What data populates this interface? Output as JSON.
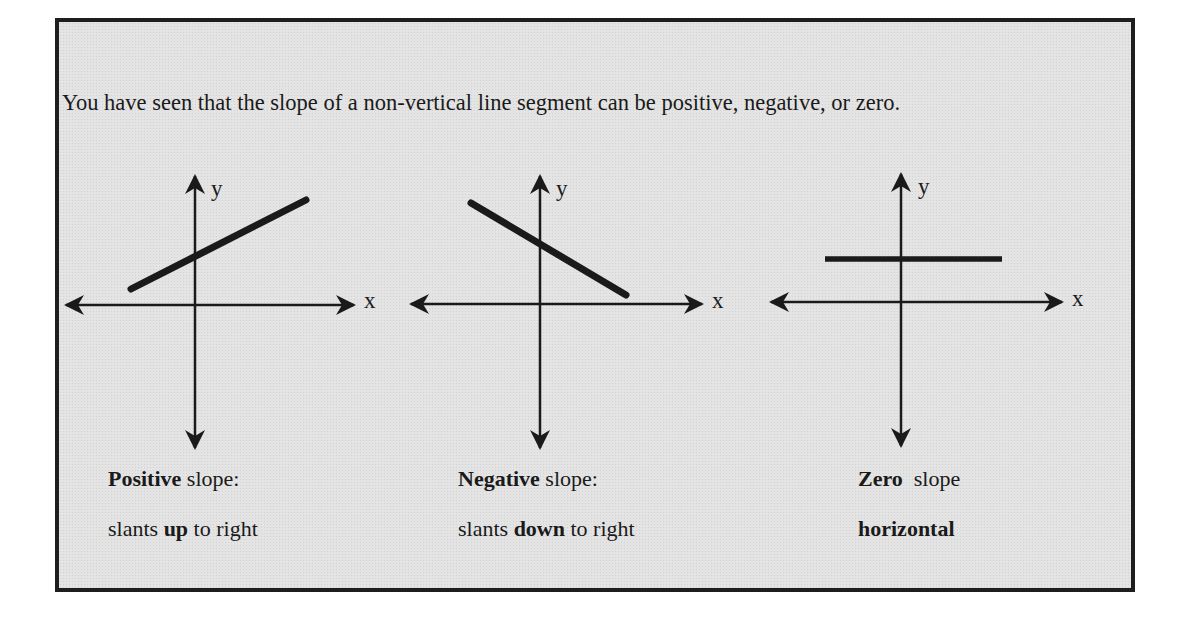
{
  "intro_text": "You have seen that the slope of a non-vertical line segment can be positive, negative, or zero.",
  "diagrams": [
    {
      "id": "positive",
      "axis_labels": {
        "x": "x",
        "y": "y"
      },
      "caption_line1_bold": "Positive",
      "caption_line1_rest": " slope:",
      "caption_line2_pre": "slants ",
      "caption_line2_bold": "up",
      "caption_line2_post": " to right"
    },
    {
      "id": "negative",
      "axis_labels": {
        "x": "x",
        "y": "y"
      },
      "caption_line1_bold": "Negative",
      "caption_line1_rest": " slope:",
      "caption_line2_pre": "slants ",
      "caption_line2_bold": "down",
      "caption_line2_post": " to right"
    },
    {
      "id": "zero",
      "axis_labels": {
        "x": "x",
        "y": "y"
      },
      "caption_line1_bold": "Zero",
      "caption_line1_rest": "  slope",
      "caption_line2_pre": "",
      "caption_line2_bold": "horizontal",
      "caption_line2_post": ""
    }
  ],
  "colors": {
    "ink": "#1a1a1a",
    "panel_bg": "#e4e4e4",
    "border": "#1e1e1e"
  }
}
